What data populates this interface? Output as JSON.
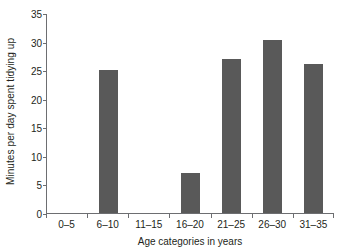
{
  "chart_data": {
    "type": "bar",
    "title": "",
    "subtitle": "",
    "categories": [
      "0–5",
      "6–10",
      "11–15",
      "16–20",
      "21–25",
      "26–30",
      "31–35"
    ],
    "values": [
      0,
      25,
      0,
      7,
      27,
      30.3,
      26
    ],
    "xlabel": "Age categories in years",
    "ylabel": "Minutes per day spent tidying up",
    "ylim": [
      0,
      35
    ],
    "ytick_values": [
      0,
      5,
      10,
      15,
      20,
      25,
      30,
      35
    ],
    "ytick_labels": [
      "0",
      "5",
      "10",
      "15",
      "20",
      "25",
      "30",
      "35"
    ],
    "grid": false,
    "legend": false,
    "legend_position": "none",
    "bar_color": "#595959",
    "axis_color": "#6d6e71",
    "background_color": "#ffffff",
    "text_color": "#231f20"
  }
}
